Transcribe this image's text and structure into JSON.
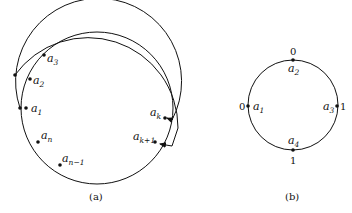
{
  "diagram_a": {
    "caption": "(a)",
    "labels": {
      "a1": {
        "base": "a",
        "sub": "1"
      },
      "a2": {
        "base": "a",
        "sub": "2"
      },
      "a3": {
        "base": "a",
        "sub": "3"
      },
      "an": {
        "base": "a",
        "sub": "n"
      },
      "an_1": {
        "base": "a",
        "sub": "n−1"
      },
      "ak": {
        "base": "a",
        "sub": "k"
      },
      "ak1": {
        "base": "a",
        "sub": "k+1"
      }
    }
  },
  "diagram_b": {
    "caption": "(b)",
    "labels": {
      "a1": {
        "base": "a",
        "sub": "1",
        "value": "0"
      },
      "a2": {
        "base": "a",
        "sub": "2",
        "value": "0"
      },
      "a3": {
        "base": "a",
        "sub": "3",
        "value": "1"
      },
      "a4": {
        "base": "a",
        "sub": "4",
        "value": "1"
      }
    }
  },
  "colors": {
    "stroke": "#111111",
    "background": "#ffffff"
  }
}
